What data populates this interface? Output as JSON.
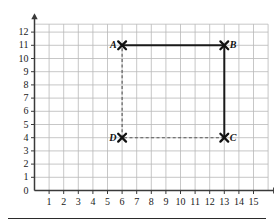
{
  "figure": {
    "title": "",
    "colors": {
      "grid": "#b9b9b9",
      "axis": "#3a3a3a",
      "solid_line": "#1a1a1a",
      "dashed_line": "#555555",
      "marker": "#111111",
      "label_text": "#111111",
      "tick_text": "#1a1a1a",
      "background": "#ffffff",
      "rule": "#2b2b2b"
    }
  },
  "chart_data": {
    "type": "scatter",
    "title": "",
    "xlabel": "",
    "ylabel": "",
    "xlim": [
      0,
      16
    ],
    "ylim": [
      0,
      12.6
    ],
    "grid": true,
    "legend": "none",
    "x_ticks": [
      1,
      2,
      3,
      4,
      5,
      6,
      7,
      8,
      9,
      10,
      11,
      12,
      13,
      14,
      15
    ],
    "x_tick_labels": [
      "1",
      "2",
      "3",
      "4",
      "5",
      "6",
      "7",
      "8",
      "9",
      "10",
      "11",
      "12",
      "13",
      "14",
      "15"
    ],
    "y_ticks": [
      1,
      2,
      3,
      4,
      5,
      6,
      7,
      8,
      9,
      10,
      11,
      12
    ],
    "y_tick_labels": [
      "1",
      "2",
      "3",
      "4",
      "5",
      "6",
      "7",
      "8",
      "9",
      "10",
      "11",
      "12"
    ],
    "origin_label": "0",
    "points": [
      {
        "name": "A",
        "label": "A",
        "x": 6,
        "y": 11,
        "marker": "x-cross",
        "label_side": "left"
      },
      {
        "name": "B",
        "label": "B",
        "x": 13,
        "y": 11,
        "marker": "x-cross",
        "label_side": "right"
      },
      {
        "name": "C",
        "label": "C",
        "x": 13,
        "y": 4,
        "marker": "x-cross",
        "label_side": "right"
      },
      {
        "name": "D",
        "label": "D",
        "x": 6,
        "y": 4,
        "marker": "x-cross",
        "label_side": "left"
      }
    ],
    "segments": [
      {
        "name": "AB",
        "from": "A",
        "to": "B",
        "style": "solid",
        "x1": 6,
        "y1": 11,
        "x2": 13,
        "y2": 11
      },
      {
        "name": "BC",
        "from": "B",
        "to": "C",
        "style": "solid",
        "x1": 13,
        "y1": 11,
        "x2": 13,
        "y2": 4
      },
      {
        "name": "CD",
        "from": "C",
        "to": "D",
        "style": "dashed",
        "x1": 13,
        "y1": 4,
        "x2": 6,
        "y2": 4
      },
      {
        "name": "DA",
        "from": "D",
        "to": "A",
        "style": "dashed",
        "x1": 6,
        "y1": 4,
        "x2": 6,
        "y2": 11
      }
    ],
    "axes": {
      "x_axis_arrow": true,
      "y_axis_arrow": true,
      "x_axis_y_value": 0,
      "y_axis_x_value": 0
    }
  }
}
